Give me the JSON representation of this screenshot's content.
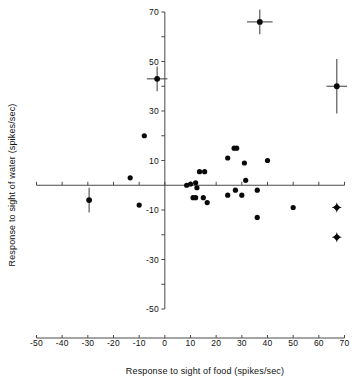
{
  "chart_data": {
    "type": "scatter",
    "title": "",
    "xlabel": "Response to sight of food (spikes/sec)",
    "ylabel": "Response to sight of water (spikes/sec)",
    "xlim": [
      -50,
      70
    ],
    "ylim": [
      -50,
      70
    ],
    "xticks": [
      -50,
      -40,
      -30,
      -20,
      -10,
      0,
      10,
      20,
      30,
      40,
      50,
      60,
      70
    ],
    "xticklabels": [
      "-50",
      "-40",
      "-30",
      "-20",
      "-10",
      "0",
      "10",
      "20",
      "30",
      "40",
      "50",
      "60",
      "70"
    ],
    "yticks": [
      -50,
      -40,
      -30,
      -20,
      -10,
      0,
      10,
      20,
      30,
      40,
      50,
      60,
      70
    ],
    "yticklabels": [
      "-50",
      "",
      "-30",
      "",
      "-10",
      "",
      "10",
      "",
      "30",
      "",
      "50",
      "",
      "70"
    ],
    "grid": false,
    "legend": null,
    "axes_style": "crossed-at-origin",
    "series": [
      {
        "name": "filled-circles",
        "marker": "circle",
        "points": [
          {
            "x": -10,
            "y": -8
          },
          {
            "x": -13.5,
            "y": 3
          },
          {
            "x": -8,
            "y": 20
          },
          {
            "x": 8.5,
            "y": 0
          },
          {
            "x": 10,
            "y": 0.5
          },
          {
            "x": 11,
            "y": -5
          },
          {
            "x": 12,
            "y": -5
          },
          {
            "x": 12,
            "y": 1
          },
          {
            "x": 12.5,
            "y": -1
          },
          {
            "x": 13.5,
            "y": 5.5
          },
          {
            "x": 15,
            "y": -5
          },
          {
            "x": 15.5,
            "y": 5.5
          },
          {
            "x": 16.5,
            "y": -7
          },
          {
            "x": 24.5,
            "y": 11
          },
          {
            "x": 24.5,
            "y": -4
          },
          {
            "x": 27,
            "y": 15
          },
          {
            "x": 28,
            "y": 15
          },
          {
            "x": 27.5,
            "y": -2
          },
          {
            "x": 30,
            "y": -4
          },
          {
            "x": 31,
            "y": 9
          },
          {
            "x": 31.5,
            "y": 2
          },
          {
            "x": 36,
            "y": -2
          },
          {
            "x": 36,
            "y": -13
          },
          {
            "x": 40,
            "y": 10
          },
          {
            "x": 50,
            "y": -9
          }
        ]
      },
      {
        "name": "mean-points-with-error-bars",
        "marker": "circle-with-errorbars",
        "points": [
          {
            "x": -3,
            "y": 43,
            "xerr": 4,
            "yerr": 5
          },
          {
            "x": 37,
            "y": 66,
            "xerr": 5,
            "yerr": 5
          },
          {
            "x": 67,
            "y": 40,
            "xerr": 4,
            "yerr": 11
          },
          {
            "x": -29.5,
            "y": -6,
            "xerr": 0,
            "yerr": 5
          }
        ]
      },
      {
        "name": "star-markers",
        "marker": "star",
        "points": [
          {
            "x": 67,
            "y": -9
          },
          {
            "x": 67,
            "y": -21
          }
        ]
      }
    ]
  },
  "axis": {
    "x_title": "Response to sight of food (spikes/sec)",
    "y_title": "Response to sight of water (spikes/sec)"
  }
}
